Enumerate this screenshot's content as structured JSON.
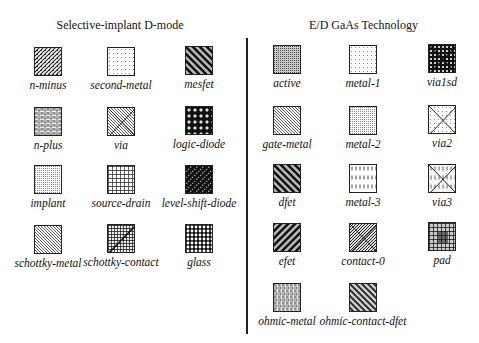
{
  "sections": [
    {
      "title": "Selective-implant D-mode",
      "items": [
        {
          "label": "n-minus",
          "pattern": "diag-fine-dense"
        },
        {
          "label": "second-metal",
          "pattern": "dots-sparse"
        },
        {
          "label": "mesfet",
          "pattern": "diag-thick-back"
        },
        {
          "label": "n-plus",
          "pattern": "brick"
        },
        {
          "label": "via",
          "pattern": "x-dots"
        },
        {
          "label": "logic-diode",
          "pattern": "dark-diamonds"
        },
        {
          "label": "implant",
          "pattern": "grid-fine"
        },
        {
          "label": "source-drain",
          "pattern": "grid-bold"
        },
        {
          "label": "level-shift-diode",
          "pattern": "dark-diag-dots"
        },
        {
          "label": "schottky-metal",
          "pattern": "diag-back-thin"
        },
        {
          "label": "schottky-contact",
          "pattern": "dark-grid-diag"
        },
        {
          "label": "glass",
          "pattern": "circles"
        }
      ]
    },
    {
      "title": "E/D GaAs Technology",
      "items": [
        {
          "label": "active",
          "pattern": "grid-fine-dark"
        },
        {
          "label": "metal-1",
          "pattern": "dots-sparse"
        },
        {
          "label": "via1sd",
          "pattern": "dark-checker-x"
        },
        {
          "label": "gate-metal",
          "pattern": "diag-back-thin"
        },
        {
          "label": "metal-2",
          "pattern": "grid-fine"
        },
        {
          "label": "via2",
          "pattern": "x-dots"
        },
        {
          "label": "dfet",
          "pattern": "diag-thick-back"
        },
        {
          "label": "metal-3",
          "pattern": "vdash"
        },
        {
          "label": "via3",
          "pattern": "x-vdash"
        },
        {
          "label": "efet",
          "pattern": "diag-thick-fwd"
        },
        {
          "label": "contact-0",
          "pattern": "x-diag-dense"
        },
        {
          "label": "pad",
          "pattern": "dark-grid-blob"
        },
        {
          "label": "ohmic-metal",
          "pattern": "brick-vertical"
        },
        {
          "label": "ohmic-contact-dfet",
          "pattern": "diag-thick-back-gray"
        }
      ]
    }
  ]
}
